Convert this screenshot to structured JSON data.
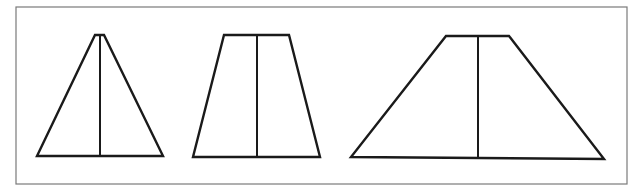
{
  "figure": {
    "frame": {
      "x1": 16,
      "y1": 7,
      "x2": 627,
      "y2": 184,
      "color": "#7a7a7a"
    },
    "stroke_color": "#1a1a1a",
    "shapes": [
      {
        "name": "narrow-triangle",
        "top_left": [
          95,
          35
        ],
        "top_right": [
          104,
          35
        ],
        "bottom_left": [
          37,
          156
        ],
        "bottom_right": [
          163,
          156
        ],
        "mid_x": 100
      },
      {
        "name": "medium-trapezoid",
        "top_left": [
          224,
          35
        ],
        "top_right": [
          289,
          35
        ],
        "bottom_left": [
          193,
          157
        ],
        "bottom_right": [
          320,
          157
        ],
        "mid_x": 257
      },
      {
        "name": "wide-trapezoid",
        "top_left": [
          446,
          36
        ],
        "top_right": [
          509,
          36
        ],
        "bottom_left": [
          351,
          157
        ],
        "bottom_right": [
          604,
          159
        ],
        "mid_x": 478
      }
    ]
  }
}
